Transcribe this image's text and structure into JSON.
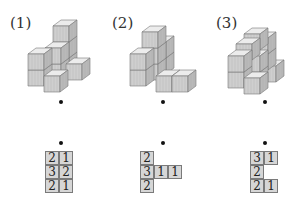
{
  "problems": [
    {
      "label": "(1)",
      "grid": [
        [
          "2",
          "1"
        ],
        [
          "3",
          "2"
        ],
        [
          "2",
          "1"
        ]
      ]
    },
    {
      "label": "(2)",
      "grid": [
        [
          "2",
          "",
          ""
        ],
        [
          "3",
          "1",
          "1"
        ],
        [
          "2",
          "",
          ""
        ]
      ]
    },
    {
      "label": "(3)",
      "grid": [
        [
          "3",
          "1"
        ],
        [
          "2",
          ""
        ],
        [
          "2",
          "1"
        ]
      ]
    }
  ],
  "colors": {
    "cube_top": "#ececec",
    "cube_left": "#cfcfcf",
    "cube_right": "#b9b9b9",
    "cell_fill": "#d6d6d6",
    "cell_border": "#7a7a7a"
  }
}
